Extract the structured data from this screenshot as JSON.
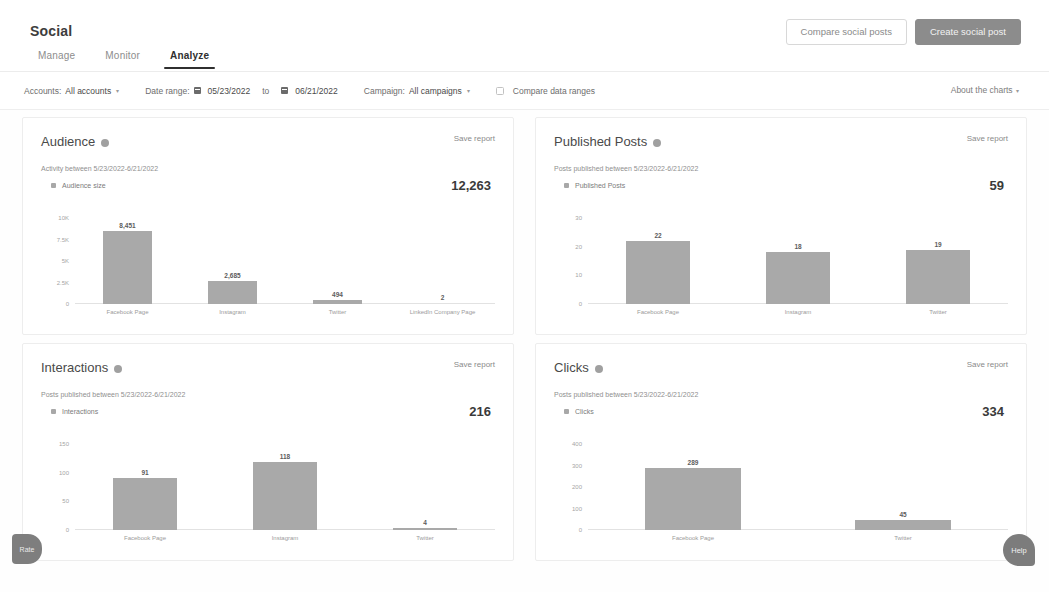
{
  "header": {
    "title": "Social",
    "actions": {
      "compare_label": "Compare social posts",
      "create_label": "Create social post"
    }
  },
  "tabs": [
    {
      "label": "Manage",
      "active": false
    },
    {
      "label": "Monitor",
      "active": false
    },
    {
      "label": "Analyze",
      "active": true
    }
  ],
  "filters": {
    "accounts_label": "Accounts:",
    "accounts_value": "All accounts",
    "date_range_label": "Date range:",
    "date_from": "05/23/2022",
    "date_to_label": "to",
    "date_to": "06/21/2022",
    "campaign_label": "Campaign:",
    "campaign_value": "All campaigns",
    "compare_ranges_label": "Compare data ranges",
    "about_charts_label": "About the charts",
    "caret": "▾"
  },
  "cards": [
    {
      "title": "Audience",
      "save_label": "Save report",
      "subtitle": "Activity between 5/23/2022-6/21/2022",
      "legend": "Audience size",
      "total": "12,263"
    },
    {
      "title": "Published Posts",
      "save_label": "Save report",
      "subtitle": "Posts published between 5/23/2022-6/21/2022",
      "legend": "Published Posts",
      "total": "59"
    },
    {
      "title": "Interactions",
      "save_label": "Save report",
      "subtitle": "Posts published between 5/23/2022-6/21/2022",
      "legend": "Interactions",
      "total": "216"
    },
    {
      "title": "Clicks",
      "save_label": "Save report",
      "subtitle": "Posts published between 5/23/2022-6/21/2022",
      "legend": "Clicks",
      "total": "334"
    }
  ],
  "chart_data": [
    {
      "type": "bar",
      "title": "Audience",
      "xlabel": "",
      "ylabel": "",
      "categories": [
        "Facebook Page",
        "Instagram",
        "Twitter",
        "LinkedIn Company Page"
      ],
      "values": [
        8451,
        2685,
        494,
        2
      ],
      "value_labels": [
        "8,451",
        "2,685",
        "494",
        "2"
      ],
      "yticks": [
        0,
        2500,
        5000,
        7500,
        10000
      ],
      "ytick_labels": [
        "0",
        "2.5K",
        "5K",
        "7.5K",
        "10K"
      ],
      "ylim": [
        0,
        10000
      ],
      "grid": false,
      "legend": "Audience size"
    },
    {
      "type": "bar",
      "title": "Published Posts",
      "xlabel": "",
      "ylabel": "",
      "categories": [
        "Facebook Page",
        "Instagram",
        "Twitter"
      ],
      "values": [
        22,
        18,
        19
      ],
      "value_labels": [
        "22",
        "18",
        "19"
      ],
      "yticks": [
        0,
        10,
        20,
        30
      ],
      "ytick_labels": [
        "0",
        "10",
        "20",
        "30"
      ],
      "ylim": [
        0,
        30
      ],
      "grid": false,
      "legend": "Published Posts"
    },
    {
      "type": "bar",
      "title": "Interactions",
      "xlabel": "",
      "ylabel": "",
      "categories": [
        "Facebook Page",
        "Instagram",
        "Twitter"
      ],
      "values": [
        91,
        118,
        4
      ],
      "value_labels": [
        "91",
        "118",
        "4"
      ],
      "yticks": [
        0,
        50,
        100,
        150
      ],
      "ytick_labels": [
        "0",
        "50",
        "100",
        "150"
      ],
      "ylim": [
        0,
        150
      ],
      "grid": false,
      "legend": "Interactions"
    },
    {
      "type": "bar",
      "title": "Clicks",
      "xlabel": "",
      "ylabel": "",
      "categories": [
        "Facebook Page",
        "Twitter"
      ],
      "values": [
        289,
        45
      ],
      "value_labels": [
        "289",
        "45"
      ],
      "yticks": [
        0,
        100,
        200,
        300,
        400
      ],
      "ytick_labels": [
        "0",
        "100",
        "200",
        "300",
        "400"
      ],
      "ylim": [
        0,
        400
      ],
      "grid": false,
      "legend": "Clicks"
    }
  ],
  "widgets": {
    "rate_label": "Rate",
    "help_label": "Help"
  },
  "colors": {
    "bar": "#a9a9a9",
    "accent": "#8c8c8c",
    "card_bg": "#ffffff",
    "page_bg": "#fefefe"
  }
}
